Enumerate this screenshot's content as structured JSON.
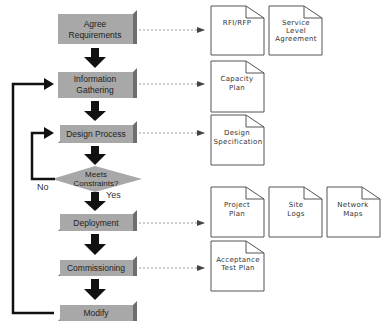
{
  "diagram": {
    "type": "flowchart",
    "colors": {
      "box_face": "#a8a8a8",
      "box_shadow": "#6e6e6e",
      "arrow": "#111111",
      "doc_border": "#555555",
      "connector": "#999999"
    },
    "process_steps": [
      {
        "id": "agree",
        "lines": [
          "Agree",
          "Requirements"
        ]
      },
      {
        "id": "info",
        "lines": [
          "Information",
          "Gathering"
        ]
      },
      {
        "id": "design",
        "lines": [
          "Design Process"
        ]
      },
      {
        "id": "decision",
        "lines": [
          "Meets",
          "Constraints?"
        ]
      },
      {
        "id": "deploy",
        "lines": [
          "Deployment"
        ]
      },
      {
        "id": "commission",
        "lines": [
          "Commissioning"
        ]
      },
      {
        "id": "modify",
        "lines": [
          "Modify"
        ]
      }
    ],
    "decision_labels": {
      "no": "No",
      "yes": "Yes"
    },
    "documents": {
      "agree": [
        {
          "lines": [
            "RFI/RFP"
          ]
        },
        {
          "lines": [
            "Service",
            "Level",
            "Agreement"
          ]
        }
      ],
      "info": [
        {
          "lines": [
            "Capacity",
            "Plan"
          ]
        }
      ],
      "design": [
        {
          "lines": [
            "Design",
            "Specification"
          ]
        }
      ],
      "deploy": [
        {
          "lines": [
            "Project",
            "Plan"
          ]
        },
        {
          "lines": [
            "Site",
            "Logs"
          ]
        },
        {
          "lines": [
            "Network",
            "Maps"
          ]
        }
      ],
      "commission": [
        {
          "lines": [
            "Acceptance",
            "Test Plan"
          ]
        }
      ]
    }
  }
}
